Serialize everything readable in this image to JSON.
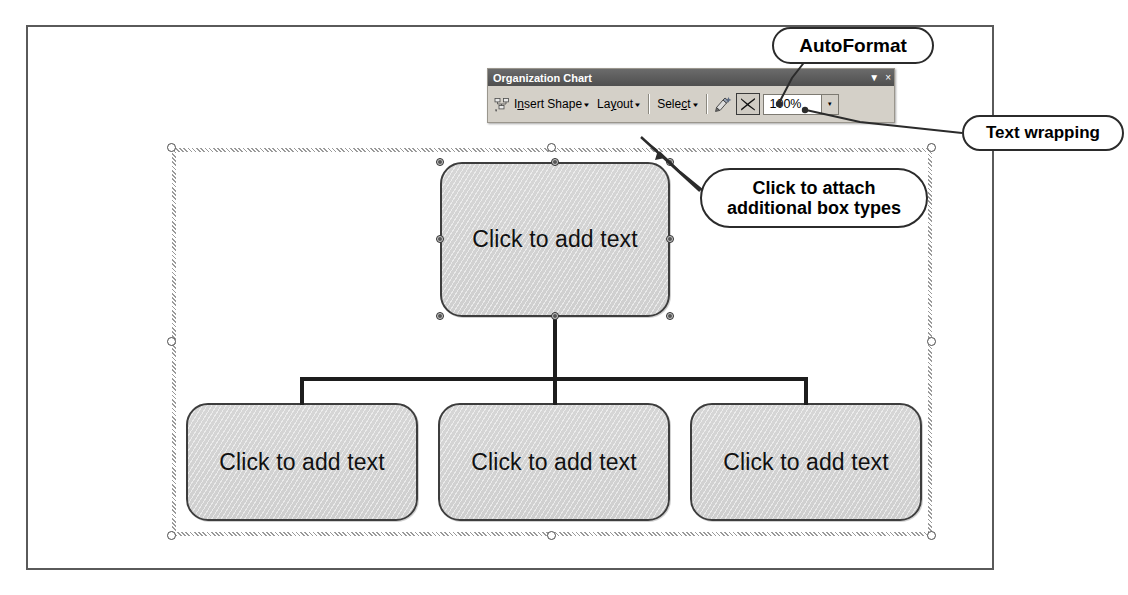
{
  "document": {
    "name": "word-document-page"
  },
  "toolbar": {
    "title": "Organization Chart",
    "options_icon": "toolbar-options-triangle",
    "close_icon": "close-x-icon",
    "close_label": "×",
    "options_label": "▼",
    "items": [
      {
        "id": "insert-shape",
        "label_pre": "I",
        "label_underline": "n",
        "label_post": "sert Shape",
        "full_label": "Insert Shape",
        "icon": "insert-shape-icon",
        "caret": "▾"
      },
      {
        "id": "layout",
        "label_pre": "La",
        "label_underline": "y",
        "label_post": "out",
        "full_label": "Layout",
        "caret": "▾"
      },
      {
        "id": "select",
        "label_pre": "Sele",
        "label_underline": "c",
        "label_post": "t",
        "full_label": "Select",
        "caret": "▾"
      },
      {
        "id": "autoformat",
        "full_label": "AutoFormat",
        "icon": "autoformat-icon"
      },
      {
        "id": "text-wrapping",
        "full_label": "Text Wrapping",
        "icon": "text-wrapping-icon"
      }
    ],
    "zoom": {
      "value": "100%",
      "arrow": "▾",
      "arrow_icon": "chevron-down-icon"
    }
  },
  "chart": {
    "type": "organization-chart",
    "root": {
      "text": "Click to add text"
    },
    "children": [
      {
        "text": "Click to add text"
      },
      {
        "text": "Click to add text"
      },
      {
        "text": "Click to add text"
      }
    ],
    "selected_node": "root",
    "handle_count_root": 8,
    "frame_handle_count": 8
  },
  "annotations": [
    {
      "id": "autoformat",
      "text": "AutoFormat",
      "points_to": "autoformat-icon"
    },
    {
      "id": "text-wrapping",
      "text": "Text wrapping",
      "points_to": "text-wrapping-icon"
    },
    {
      "id": "attach-boxes",
      "line1": "Click to attach",
      "line2": "additional box types",
      "points_to": "insert-shape-button"
    }
  ],
  "colors": {
    "node_fill": "#d2d2d2",
    "node_border": "#3d3d3d",
    "toolbar_face": "#d4d0c8",
    "titlebar": "#5a5a5a",
    "connector": "#1d1d1d",
    "callout_border": "#2b2b2b"
  }
}
